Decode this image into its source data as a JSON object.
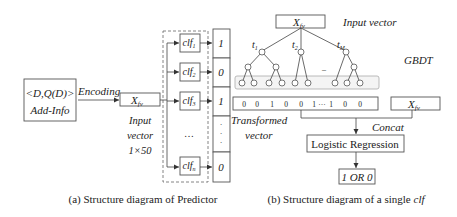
{
  "panel_a": {
    "source_box": {
      "line1": "<D,Q(D)>",
      "line2": "Add-Info"
    },
    "encoding_label": "Encoding",
    "input_box": {
      "main": "X",
      "sub": "fv"
    },
    "input_caption": {
      "line1": "Input",
      "line2": "vector",
      "line3": "1×50"
    },
    "classifiers": [
      {
        "main": "clf",
        "sub": "1",
        "output": "1"
      },
      {
        "main": "clf",
        "sub": "2",
        "output": "0"
      },
      {
        "main": "clf",
        "sub": "3",
        "output": "1"
      },
      {
        "main": "clf",
        "sub": "n",
        "output": "0"
      }
    ],
    "ellipsis": "…",
    "output_ellipsis": "·",
    "caption": "(a) Structure diagram of Predictor"
  },
  "panel_b": {
    "input_box": {
      "main": "X",
      "sub": "fv"
    },
    "input_label": "Input  vector",
    "gbdt_label": "GBDT",
    "trees": [
      {
        "main": "t",
        "sub": "1"
      },
      {
        "main": "t",
        "sub": "2"
      },
      {
        "main": "t",
        "sub": "M"
      }
    ],
    "transformed_values": [
      "0",
      "0",
      "1",
      "0",
      "0",
      "1",
      "···",
      "1",
      "0",
      "0"
    ],
    "transformed_label": {
      "line1": "Transformed",
      "line2": "vector"
    },
    "concat_box": {
      "main": "X",
      "sub": "fv"
    },
    "concat_label": "Concat",
    "lr_box": "Logistic Regression",
    "output_box": "1 OR 0",
    "caption_prefix": "(b) Structure diagram of a single ",
    "caption_italic": "clf"
  }
}
